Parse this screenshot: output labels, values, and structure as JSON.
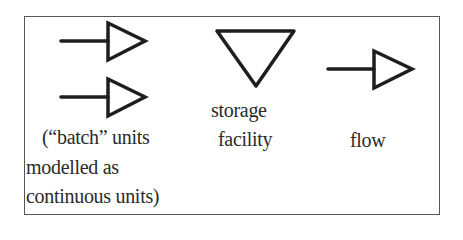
{
  "legend": {
    "items": [
      {
        "id": "batch",
        "symbol": "double-open-arrow",
        "label_lines": [
          "(“batch” units",
          "modelled as",
          "continuous units)"
        ]
      },
      {
        "id": "storage",
        "symbol": "inverted-triangle",
        "label_lines": [
          "storage",
          "facility"
        ]
      },
      {
        "id": "flow",
        "symbol": "open-arrow",
        "label_lines": [
          "flow"
        ]
      }
    ]
  },
  "colors": {
    "stroke": "#1e1e1e",
    "border": "#555555",
    "background": "#ffffff"
  }
}
